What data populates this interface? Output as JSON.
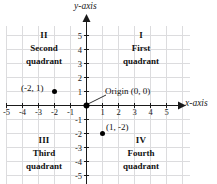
{
  "figure": {
    "kind": "cartesian-coordinate-plane",
    "axis_titles": {
      "x": "x-axis",
      "y": "y-axis"
    },
    "colors": {
      "grid": "#dcdcde",
      "axis": "#1a1a1a",
      "text": "#111111",
      "point": "#000000",
      "background": "#ffffff"
    },
    "axis_range": {
      "x": [
        -6,
        6
      ],
      "y": [
        -6,
        6
      ]
    },
    "ticks": {
      "x_labels": [
        "-5",
        "-4",
        "-3",
        "-2",
        "-1",
        "1",
        "2",
        "3",
        "4",
        "5"
      ],
      "x_values": [
        -5,
        -4,
        -3,
        -2,
        -1,
        1,
        2,
        3,
        4,
        5
      ],
      "y_labels": [
        "5",
        "4",
        "3",
        "2",
        "1",
        "-1",
        "-2",
        "-3",
        "-4",
        "-5"
      ],
      "y_values": [
        5,
        4,
        3,
        2,
        1,
        -1,
        -2,
        -3,
        -4,
        -5
      ]
    },
    "origin": {
      "label": "Origin (0, 0)",
      "x": 0,
      "y": 0
    },
    "quadrants": [
      {
        "roman": "I",
        "name": "First",
        "word": "quadrant"
      },
      {
        "roman": "II",
        "name": "Second",
        "word": "quadrant"
      },
      {
        "roman": "III",
        "name": "Third",
        "word": "quadrant"
      },
      {
        "roman": "IV",
        "name": "Fourth",
        "word": "quadrant"
      }
    ],
    "points": [
      {
        "label": "(-2, 1)",
        "x": -2,
        "y": 1
      },
      {
        "label": "(1, -2)",
        "x": 1,
        "y": -2
      }
    ]
  }
}
